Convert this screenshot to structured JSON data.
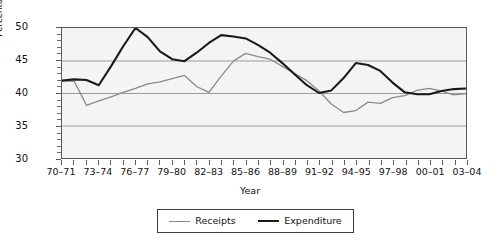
{
  "chart_data": {
    "type": "line",
    "title": "",
    "xlabel": "Year",
    "ylabel": "Percentage of GDP",
    "ylim": [
      30,
      50
    ],
    "yticks": [
      30,
      35,
      40,
      45,
      50
    ],
    "grid": true,
    "legend_position": "bottom",
    "categories": [
      "70-71",
      "71-72",
      "72-73",
      "73-74",
      "74-75",
      "75-76",
      "76-77",
      "77-78",
      "78-79",
      "79-80",
      "80-81",
      "81-82",
      "82-83",
      "83-84",
      "84-85",
      "85-86",
      "86-87",
      "87-88",
      "88-89",
      "89-90",
      "90-91",
      "91-92",
      "92-93",
      "93-94",
      "94-95",
      "95-96",
      "96-97",
      "97-98",
      "98-99",
      "99-00",
      "00-01",
      "01-02",
      "02-03",
      "03-04"
    ],
    "tick_labels": [
      "70-71",
      "",
      "",
      "73-74",
      "",
      "",
      "76-77",
      "",
      "",
      "79-80",
      "",
      "",
      "82-83",
      "",
      "",
      "85-86",
      "",
      "",
      "88-89",
      "",
      "",
      "91-92",
      "",
      "",
      "94-95",
      "",
      "",
      "97-98",
      "",
      "",
      "00-01",
      "",
      "",
      "03-04"
    ],
    "series": [
      {
        "name": "Receipts",
        "color": "#8a8a8a",
        "values": [
          41.9,
          41.8,
          38.1,
          38.8,
          39.4,
          40.1,
          40.7,
          41.4,
          41.7,
          42.2,
          42.7,
          41.0,
          40.1,
          42.6,
          44.9,
          46.1,
          45.6,
          45.2,
          44.1,
          43.0,
          41.9,
          40.3,
          38.3,
          37.0,
          37.3,
          38.6,
          38.4,
          39.3,
          39.6,
          40.4,
          40.7,
          40.3,
          39.7,
          39.9
        ]
      },
      {
        "name": "Expenditure",
        "color": "#1a1a1a",
        "values": [
          41.9,
          42.1,
          42.0,
          41.2,
          44.1,
          47.2,
          50.0,
          48.6,
          46.4,
          45.2,
          44.9,
          46.2,
          47.7,
          48.9,
          48.7,
          48.4,
          47.4,
          46.2,
          44.6,
          42.9,
          41.2,
          40.0,
          40.4,
          42.3,
          44.6,
          44.3,
          43.4,
          41.6,
          40.1,
          39.8,
          39.8,
          40.3,
          40.6,
          40.7
        ]
      }
    ]
  },
  "legend": {
    "entries": [
      {
        "label": "Receipts",
        "icon": "line-swatch-grey"
      },
      {
        "label": "Expenditure",
        "icon": "line-swatch-black"
      }
    ]
  },
  "axes": {
    "y_title": "Percentage of GDP",
    "x_title": "Year"
  }
}
